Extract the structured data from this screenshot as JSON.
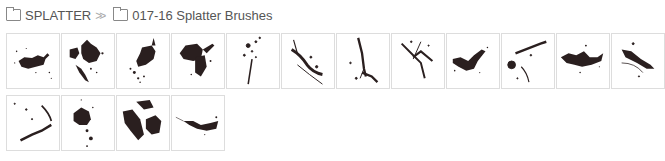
{
  "breadcrumb": {
    "items": [
      {
        "label": "SPLATTER",
        "icon": "folder-icon"
      },
      {
        "label": "017-16 Splatter Brushes",
        "icon": "folder-icon"
      }
    ],
    "separator": "»"
  },
  "brush_color": "#2a1f1f",
  "brushes": [
    {
      "id": "1"
    },
    {
      "id": "2"
    },
    {
      "id": "3"
    },
    {
      "id": "4"
    },
    {
      "id": "5"
    },
    {
      "id": "6"
    },
    {
      "id": "7"
    },
    {
      "id": "8"
    },
    {
      "id": "9"
    },
    {
      "id": "10"
    },
    {
      "id": "11"
    },
    {
      "id": "12"
    },
    {
      "id": "13"
    },
    {
      "id": "14"
    },
    {
      "id": "15"
    },
    {
      "id": "16"
    }
  ]
}
